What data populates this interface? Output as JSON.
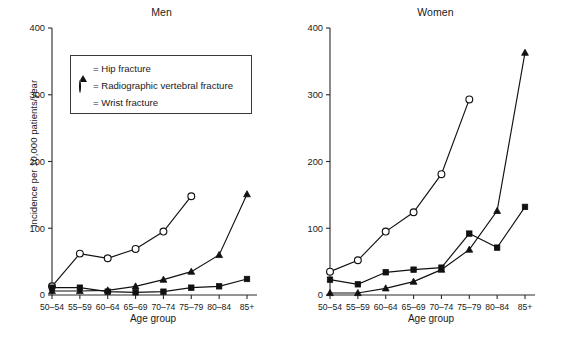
{
  "figure": {
    "ylabel": "Incidence per 10,000 patients/year",
    "xlabel": "Age group",
    "categories": [
      "50–54",
      "55–59",
      "60–64",
      "65–69",
      "70–74",
      "75–79",
      "80–84",
      "85+"
    ],
    "yticks": [
      "0",
      "100",
      "200",
      "300",
      "400"
    ]
  },
  "legend": {
    "items": [
      {
        "marker": "triangle-marker",
        "label": "= Hip fracture"
      },
      {
        "marker": "circle-marker",
        "label": "= Radiographic vertebral fracture"
      },
      {
        "marker": "square-marker",
        "label": "= Wrist fracture"
      }
    ]
  },
  "panels": {
    "men": {
      "title": "Men",
      "xlabel": "Age group"
    },
    "women": {
      "title": "Women",
      "xlabel": "Age group"
    }
  },
  "chart_data": [
    {
      "type": "line",
      "title": "Men",
      "xlabel": "Age group",
      "ylabel": "Incidence per 10,000 patients/year",
      "categories": [
        "50–54",
        "55–59",
        "60–64",
        "65–69",
        "70–74",
        "75–79",
        "80–84",
        "85+"
      ],
      "ylim": [
        0,
        400
      ],
      "yticks": [
        0,
        100,
        200,
        300,
        400
      ],
      "grid": false,
      "legend_position": "upper-left",
      "series": [
        {
          "name": "Hip fracture",
          "marker": "triangle",
          "values": [
            6,
            6,
            7,
            13,
            23,
            35,
            60,
            151
          ]
        },
        {
          "name": "Radiographic vertebral fracture",
          "marker": "circle",
          "values": [
            13,
            62,
            55,
            69,
            95,
            148,
            null,
            null
          ]
        },
        {
          "name": "Wrist fracture",
          "marker": "square",
          "values": [
            11,
            11,
            5,
            4,
            5,
            11,
            13,
            24
          ]
        }
      ]
    },
    {
      "type": "line",
      "title": "Women",
      "xlabel": "Age group",
      "ylabel": "Incidence per 10,000 patients/year",
      "categories": [
        "50–54",
        "55–59",
        "60–64",
        "65–69",
        "70–74",
        "75–79",
        "80–84",
        "85+"
      ],
      "ylim": [
        0,
        400
      ],
      "yticks": [
        0,
        100,
        200,
        300,
        400
      ],
      "grid": false,
      "legend_position": "none",
      "series": [
        {
          "name": "Hip fracture",
          "marker": "triangle",
          "values": [
            3,
            3,
            10,
            20,
            38,
            68,
            126,
            363
          ]
        },
        {
          "name": "Radiographic vertebral fracture",
          "marker": "circle",
          "values": [
            35,
            52,
            95,
            124,
            181,
            293,
            null,
            null
          ]
        },
        {
          "name": "Wrist fracture",
          "marker": "square",
          "values": [
            23,
            16,
            34,
            38,
            41,
            92,
            71,
            132
          ]
        }
      ]
    }
  ]
}
